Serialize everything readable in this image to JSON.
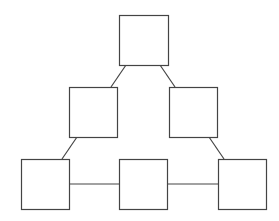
{
  "diagram": {
    "type": "graph",
    "stroke_color": "#444444",
    "background": "#ffffff",
    "nodes": [
      {
        "id": "top",
        "label": "",
        "x": 119,
        "y": 15,
        "w": 49,
        "h": 50
      },
      {
        "id": "mid-left",
        "label": "",
        "x": 69,
        "y": 87,
        "w": 48,
        "h": 50
      },
      {
        "id": "mid-right",
        "label": "",
        "x": 169,
        "y": 87,
        "w": 48,
        "h": 50
      },
      {
        "id": "bottom-left",
        "label": "",
        "x": 21,
        "y": 159,
        "w": 48,
        "h": 50
      },
      {
        "id": "bottom-center",
        "label": "",
        "x": 119,
        "y": 159,
        "w": 48,
        "h": 50
      },
      {
        "id": "bottom-right",
        "label": "",
        "x": 218,
        "y": 159,
        "w": 48,
        "h": 50
      }
    ],
    "edges": [
      {
        "from": "top",
        "to": "mid-left"
      },
      {
        "from": "top",
        "to": "mid-right"
      },
      {
        "from": "mid-left",
        "to": "bottom-left"
      },
      {
        "from": "mid-right",
        "to": "bottom-right"
      },
      {
        "from": "bottom-left",
        "to": "bottom-center"
      },
      {
        "from": "bottom-center",
        "to": "bottom-right"
      }
    ]
  }
}
